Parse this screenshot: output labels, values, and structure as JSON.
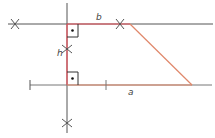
{
  "diagram": {
    "labels": {
      "top_side": "b",
      "height": "h",
      "bottom_side": "a"
    },
    "colors": {
      "construction": "#555555",
      "red": "#e8505b",
      "salmon": "#e0876a",
      "text": "#444444"
    }
  }
}
